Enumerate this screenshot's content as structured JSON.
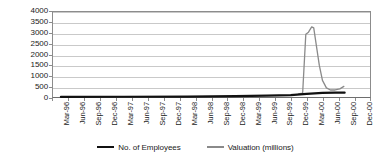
{
  "chart_data": {
    "type": "line",
    "title": "",
    "subtitle": "",
    "xlabel": "",
    "ylabel": "",
    "ylim": [
      0,
      4000
    ],
    "grid": true,
    "legend_position": "bottom",
    "y_ticks": [
      0,
      500,
      1000,
      1500,
      2000,
      2500,
      3000,
      3500,
      4000
    ],
    "y_tick_labels": [
      "0",
      "500",
      "1000",
      "1500",
      "2000",
      "2500",
      "3000",
      "3500",
      "4000"
    ],
    "categories": [
      "Mar-96",
      "Jun-96",
      "Sep-96",
      "Dec-96",
      "Mar-97",
      "Jun-97",
      "Sep-97",
      "Dec-97",
      "Mar-98",
      "Jun-98",
      "Sep-98",
      "Dec-98",
      "Mar-99",
      "Jun-99",
      "Sep-99",
      "Dec-99",
      "Mar-00",
      "Jun-00",
      "Sep-00",
      "Dec-00"
    ],
    "series": [
      {
        "name": "No. of Employees",
        "color": "#111111",
        "width": 2.2,
        "values": [
          5,
          6,
          8,
          10,
          12,
          14,
          16,
          18,
          20,
          25,
          30,
          38,
          48,
          60,
          75,
          100,
          150,
          200,
          null,
          null
        ]
      },
      {
        "name": "Valuation (millions)",
        "color": "#8a8a8a",
        "width": 1.3,
        "values": [
          2,
          3,
          4,
          5,
          6,
          7,
          8,
          9,
          10,
          12,
          15,
          20,
          28,
          40,
          60,
          140,
          3300,
          500,
          null,
          null
        ]
      }
    ],
    "annotations": [
      {
        "text": "Valuation peaks at approximately 3300 between Dec-99 and Mar-00",
        "series": "Valuation (millions)",
        "peak_value": 3300
      }
    ],
    "valuation_dense_points": [
      {
        "x": 15.0,
        "y": 150
      },
      {
        "x": 15.25,
        "y": 180
      },
      {
        "x": 15.45,
        "y": 2950
      },
      {
        "x": 15.62,
        "y": 3050
      },
      {
        "x": 15.82,
        "y": 3300
      },
      {
        "x": 15.95,
        "y": 3250
      },
      {
        "x": 16.1,
        "y": 2500
      },
      {
        "x": 16.3,
        "y": 1500
      },
      {
        "x": 16.5,
        "y": 780
      },
      {
        "x": 16.75,
        "y": 430
      },
      {
        "x": 17.0,
        "y": 330
      },
      {
        "x": 17.3,
        "y": 330
      },
      {
        "x": 17.6,
        "y": 380
      },
      {
        "x": 17.85,
        "y": 500
      }
    ],
    "employees_dense_points": [
      {
        "x": 0,
        "y": 5
      },
      {
        "x": 4,
        "y": 12
      },
      {
        "x": 8,
        "y": 22
      },
      {
        "x": 11,
        "y": 38
      },
      {
        "x": 13,
        "y": 60
      },
      {
        "x": 14.5,
        "y": 90
      },
      {
        "x": 15.5,
        "y": 150
      },
      {
        "x": 16.5,
        "y": 190
      },
      {
        "x": 17.3,
        "y": 210
      },
      {
        "x": 17.9,
        "y": 205
      }
    ]
  },
  "legend": {
    "items": [
      {
        "label": "No. of Employees"
      },
      {
        "label": "Valuation (millions)"
      }
    ]
  }
}
